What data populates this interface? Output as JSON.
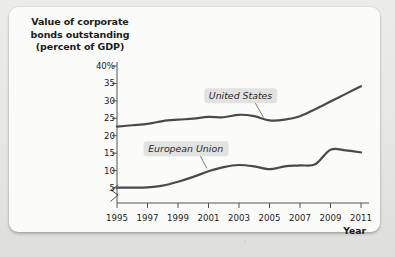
{
  "chart_data": {
    "type": "line",
    "title": "Value of corporate bonds outstanding (percent of GDP)",
    "title_lines": [
      "Value of corporate",
      "bonds outstanding",
      "(percent of GDP)"
    ],
    "xlabel": "Year",
    "ylabel": "",
    "x": [
      1995,
      1996,
      1997,
      1998,
      1999,
      2000,
      2001,
      2002,
      2003,
      2004,
      2005,
      2006,
      2007,
      2008,
      2009,
      2010,
      2011
    ],
    "xticks": [
      1995,
      1997,
      1999,
      2001,
      2003,
      2005,
      2007,
      2009,
      2011
    ],
    "xtick_labels": [
      "1995",
      "1997",
      "1999",
      "2001",
      "2003",
      "2005",
      "2007",
      "2009",
      "2011"
    ],
    "yticks": [
      5,
      10,
      15,
      20,
      25,
      30,
      35,
      40
    ],
    "ytick_labels": [
      "5",
      "10",
      "15",
      "20",
      "25",
      "30",
      "35",
      "40%"
    ],
    "ylim": [
      3.5,
      40
    ],
    "xlim": [
      1995,
      2011
    ],
    "axis_break": true,
    "grid": false,
    "legend_position": "inline-annotations",
    "line_color": "#4a4a4a",
    "series": [
      {
        "name": "United States",
        "label_x": 2003.1,
        "label_y": 31.5,
        "leader_to_x": 2004.6,
        "leader_to_y": 25.3,
        "values": [
          22.6,
          23.0,
          23.4,
          24.2,
          24.6,
          24.9,
          25.4,
          25.3,
          26.0,
          25.6,
          24.4,
          24.6,
          25.6,
          27.6,
          29.8,
          32.0,
          34.2
        ]
      },
      {
        "name": "European Union",
        "label_x": 1999.5,
        "label_y": 16.3,
        "leader_to_x": 2000.9,
        "leader_to_y": 10.6,
        "values": [
          5.1,
          5.1,
          5.2,
          5.7,
          6.8,
          8.2,
          9.8,
          11.0,
          11.6,
          11.2,
          10.4,
          11.2,
          11.5,
          11.8,
          16.0,
          15.8,
          15.2
        ]
      }
    ]
  }
}
